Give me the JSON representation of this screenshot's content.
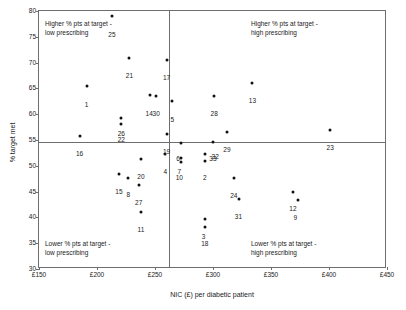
{
  "chart_data": {
    "type": "scatter",
    "title": "",
    "xlabel": "NIC (£) per diabetic patient",
    "ylabel": "% target met",
    "xlim": [
      150,
      450
    ],
    "ylim": [
      30,
      80
    ],
    "xticks": [
      "£150",
      "£200",
      "£250",
      "£300",
      "£350",
      "£400",
      "£450"
    ],
    "xtick_values": [
      150,
      200,
      250,
      300,
      350,
      400,
      450
    ],
    "yticks": [
      "30",
      "35",
      "40",
      "45",
      "50",
      "55",
      "60",
      "65",
      "70",
      "75",
      "80"
    ],
    "ytick_values": [
      30,
      35,
      40,
      45,
      50,
      55,
      60,
      65,
      70,
      75,
      80
    ],
    "grid": false,
    "legend": "none",
    "reference_lines": {
      "vertical_x": 262,
      "horizontal_y": 54.6,
      "color": "#6e6e6e"
    },
    "point_color": "#111111",
    "quadrant_notes": [
      {
        "id": "top-left",
        "text": "Higher % pts at target -\nlow prescribing"
      },
      {
        "id": "top-right",
        "text": "Higher % pts at target -\nhigh prescribing"
      },
      {
        "id": "bottom-left",
        "text": "Lower % pts at target -\nlow prescribing"
      },
      {
        "id": "bottom-right",
        "text": "Lower % pts at target -\nhigh prescribing"
      }
    ],
    "points": [
      {
        "label": "25",
        "x": 213,
        "y": 79.1,
        "lx": 213,
        "ly": 76.0
      },
      {
        "label": "21",
        "x": 228,
        "y": 70.9,
        "lx": 228,
        "ly": 67.9
      },
      {
        "label": "17",
        "x": 260,
        "y": 70.6,
        "lx": 260,
        "ly": 67.6
      },
      {
        "label": "13",
        "x": 334,
        "y": 66.1,
        "lx": 334,
        "ly": 63.1
      },
      {
        "label": "1",
        "x": 191,
        "y": 65.4,
        "lx": 191,
        "ly": 62.4
      },
      {
        "label": "14",
        "x": 246,
        "y": 63.8,
        "lx": 245,
        "ly": 60.6
      },
      {
        "label": "30",
        "x": 251,
        "y": 63.5,
        "lx": 251,
        "ly": 60.6
      },
      {
        "label": "28",
        "x": 301,
        "y": 63.6,
        "lx": 301,
        "ly": 60.6
      },
      {
        "label": "5",
        "x": 265,
        "y": 62.5,
        "lx": 265,
        "ly": 59.4
      },
      {
        "label": "26",
        "x": 221,
        "y": 59.3,
        "lx": 221,
        "ly": 56.7
      },
      {
        "label": "22",
        "x": 221,
        "y": 58.1,
        "lx": 221,
        "ly": 55.6
      },
      {
        "label": "23",
        "x": 401,
        "y": 56.9,
        "lx": 401,
        "ly": 54.0
      },
      {
        "label": "29",
        "x": 312,
        "y": 56.5,
        "lx": 312,
        "ly": 53.6
      },
      {
        "label": "19",
        "x": 260,
        "y": 56.1,
        "lx": 260,
        "ly": 53.3
      },
      {
        "label": "16",
        "x": 185,
        "y": 55.8,
        "lx": 185,
        "ly": 52.8
      },
      {
        "label": "6",
        "x": 272,
        "y": 54.5,
        "lx": 270,
        "ly": 51.9
      },
      {
        "label": "33",
        "x": 300,
        "y": 54.7,
        "lx": 300,
        "ly": 51.9
      },
      {
        "label": "4",
        "x": 259,
        "y": 52.3,
        "lx": 259,
        "ly": 49.3
      },
      {
        "label": "32",
        "x": 293,
        "y": 52.2,
        "lx": 302,
        "ly": 52.2
      },
      {
        "label": "7",
        "x": 272,
        "y": 51.6,
        "lx": 271,
        "ly": 49.4
      },
      {
        "label": "10",
        "x": 272,
        "y": 50.7,
        "lx": 271,
        "ly": 48.2
      },
      {
        "label": "2",
        "x": 293,
        "y": 51.0,
        "lx": 293,
        "ly": 48.2
      },
      {
        "label": "20",
        "x": 238,
        "y": 51.3,
        "lx": 238,
        "ly": 48.4
      },
      {
        "label": "15",
        "x": 219,
        "y": 48.4,
        "lx": 219,
        "ly": 45.5
      },
      {
        "label": "8",
        "x": 227,
        "y": 47.7,
        "lx": 227,
        "ly": 45.0
      },
      {
        "label": "24",
        "x": 318,
        "y": 47.6,
        "lx": 318,
        "ly": 44.7
      },
      {
        "label": "27",
        "x": 236,
        "y": 46.2,
        "lx": 236,
        "ly": 43.4
      },
      {
        "label": "12",
        "x": 369,
        "y": 45.0,
        "lx": 369,
        "ly": 42.2
      },
      {
        "label": "9",
        "x": 373,
        "y": 43.3,
        "lx": 371,
        "ly": 40.5
      },
      {
        "label": "31",
        "x": 322,
        "y": 43.6,
        "lx": 322,
        "ly": 40.7
      },
      {
        "label": "11",
        "x": 238,
        "y": 41.1,
        "lx": 238,
        "ly": 38.1
      },
      {
        "label": "3",
        "x": 293,
        "y": 39.7,
        "lx": 292,
        "ly": 36.8
      },
      {
        "label": "18",
        "x": 293,
        "y": 38.1,
        "lx": 293,
        "ly": 35.4
      }
    ]
  }
}
